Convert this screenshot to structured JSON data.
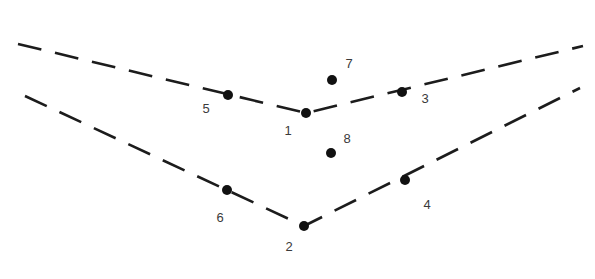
{
  "figure": {
    "background_color": "#ffffff",
    "line_color": "#1c1c1c",
    "point_color": "#111111",
    "label_color": "#3a3a3a",
    "width": 595,
    "height": 279
  },
  "chart_data": {
    "type": "scatter",
    "title": "",
    "xlabel": "",
    "ylabel": "",
    "xlim": [
      0,
      595
    ],
    "ylim": [
      279,
      0
    ],
    "grid": false,
    "legend": null,
    "polylines": [
      {
        "name": "upper-chevron",
        "style": "dashed",
        "dash_pattern": [
          24,
          14
        ],
        "stroke_width": 2.6,
        "color": "#1c1c1c",
        "points": [
          [
            18,
            44
          ],
          [
            306,
            113
          ],
          [
            583,
            46
          ]
        ]
      },
      {
        "name": "lower-chevron",
        "style": "dashed",
        "dash_pattern": [
          24,
          14
        ],
        "stroke_width": 2.6,
        "color": "#1c1c1c",
        "points": [
          [
            25,
            96
          ],
          [
            304,
            226
          ],
          [
            580,
            88
          ]
        ]
      }
    ],
    "points": [
      {
        "label": "1",
        "x": 306,
        "y": 113,
        "r": 5.0,
        "label_x": 288,
        "label_y": 135,
        "on_line": "upper-chevron",
        "role": "vertex"
      },
      {
        "label": "2",
        "x": 304,
        "y": 226,
        "r": 5.0,
        "label_x": 289,
        "label_y": 251,
        "on_line": "lower-chevron",
        "role": "vertex"
      },
      {
        "label": "3",
        "x": 402,
        "y": 92,
        "r": 5.0,
        "label_x": 425,
        "label_y": 103,
        "on_line": "upper-chevron",
        "role": "on-line"
      },
      {
        "label": "4",
        "x": 405,
        "y": 180,
        "r": 5.0,
        "label_x": 427,
        "label_y": 209,
        "on_line": "lower-chevron",
        "role": "on-line"
      },
      {
        "label": "5",
        "x": 228,
        "y": 95,
        "r": 5.0,
        "label_x": 206,
        "label_y": 113,
        "on_line": "upper-chevron",
        "role": "on-line"
      },
      {
        "label": "6",
        "x": 227,
        "y": 190,
        "r": 5.0,
        "label_x": 220,
        "label_y": 222,
        "on_line": "lower-chevron",
        "role": "on-line"
      },
      {
        "label": "7",
        "x": 332,
        "y": 80,
        "r": 5.0,
        "label_x": 349,
        "label_y": 68,
        "on_line": null,
        "role": "free"
      },
      {
        "label": "8",
        "x": 331,
        "y": 153,
        "r": 5.0,
        "label_x": 347,
        "label_y": 143,
        "on_line": null,
        "role": "free"
      }
    ]
  }
}
